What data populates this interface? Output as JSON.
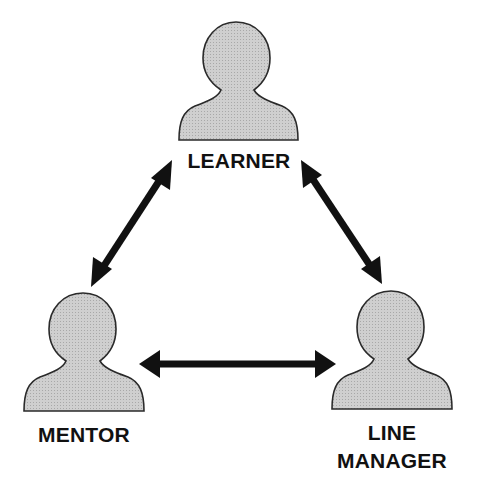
{
  "diagram": {
    "type": "relationship-triangle",
    "nodes": [
      {
        "id": "learner",
        "label": "LEARNER",
        "icon": "person-icon"
      },
      {
        "id": "mentor",
        "label": "MENTOR",
        "icon": "person-icon"
      },
      {
        "id": "line_manager",
        "label_line1": "LINE",
        "label_line2": "MANAGER",
        "icon": "person-icon"
      }
    ],
    "edges": [
      {
        "from": "learner",
        "to": "mentor",
        "style": "bidirectional-arrow"
      },
      {
        "from": "learner",
        "to": "line_manager",
        "style": "bidirectional-arrow"
      },
      {
        "from": "mentor",
        "to": "line_manager",
        "style": "bidirectional-arrow"
      }
    ],
    "colors": {
      "figure_fill": "#c9c9c9",
      "figure_stroke": "#2a2a2a",
      "arrow": "#111111",
      "text": "#111111"
    }
  }
}
